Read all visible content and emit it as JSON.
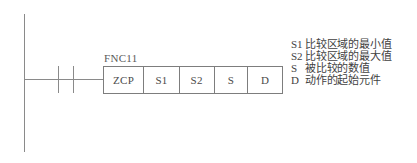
{
  "diagram": {
    "type": "plc-ladder-logic",
    "rail": {
      "name": "left-power-rail"
    },
    "contact": {
      "name": "normally-open-contact",
      "type": "no-contact"
    },
    "instruction": {
      "fnc_label": "FNC11",
      "cells": [
        {
          "label": "ZCP",
          "role": "instruction-mnemonic"
        },
        {
          "label": "S1",
          "role": "operand"
        },
        {
          "label": "S2",
          "role": "operand"
        },
        {
          "label": "S",
          "role": "operand"
        },
        {
          "label": "D",
          "role": "operand"
        }
      ]
    }
  },
  "legend": {
    "rows": [
      {
        "symbol": "S1",
        "description": "比较区域的最小值"
      },
      {
        "symbol": "S2",
        "description": "比较区域的最大值"
      },
      {
        "symbol": "S",
        "description": "被比较的数值"
      },
      {
        "symbol": "D",
        "description": "动作的起始元件"
      }
    ]
  },
  "colors": {
    "background": "#ffffff",
    "line": "#8a8a8a",
    "box_border": "#7d7d7d",
    "text": "#4a4a4a"
  }
}
